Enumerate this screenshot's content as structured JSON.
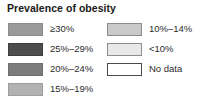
{
  "legend": {
    "title": "Prevalence of obesity",
    "columns": [
      {
        "name": "left",
        "items": [
          {
            "label": "≥30%",
            "color": "#9a9a9a",
            "border": "#8c8c8c"
          },
          {
            "label": "25%–29%",
            "color": "#4d4d4d",
            "border": "#3d3d3d"
          },
          {
            "label": "20%–24%",
            "color": "#7c7c7c",
            "border": "#6e6e6e"
          },
          {
            "label": "15%–19%",
            "color": "#b2b2b2",
            "border": "#9e9e9e"
          }
        ]
      },
      {
        "name": "right",
        "items": [
          {
            "label": "10%–14%",
            "color": "#c9c9c9",
            "border": "#8c8c8c"
          },
          {
            "label": "<10%",
            "color": "#e8e8e8",
            "border": "#8c8c8c"
          },
          {
            "label": "No data",
            "color": "#ffffff",
            "border": "#4a4a4a"
          }
        ]
      }
    ]
  }
}
